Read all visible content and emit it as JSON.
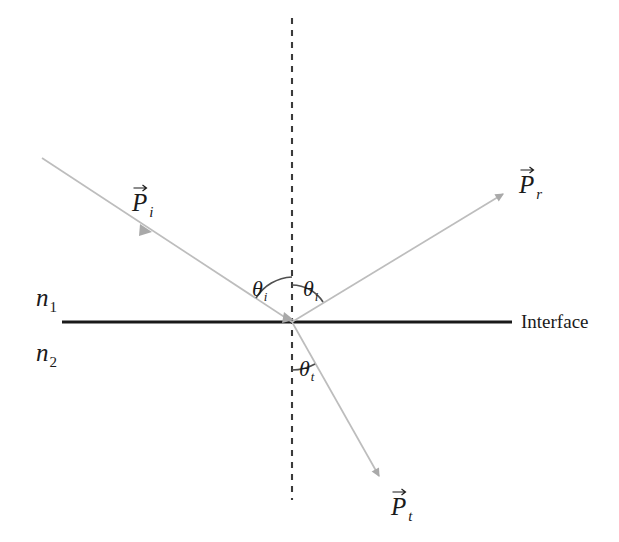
{
  "figure": {
    "type": "optics-ray-diagram",
    "background_color": "#ffffff",
    "ray_color": "#b9b9b9",
    "line_color": "#1a1a1a",
    "arc_color": "#4f4f4f"
  },
  "labels": {
    "media_upper": "n",
    "media_upper_sub": "1",
    "media_lower": "n",
    "media_lower_sub": "2",
    "interface": "Interface",
    "incident_vector": "P",
    "incident_vector_sub": "i",
    "reflected_vector": "P",
    "reflected_vector_sub": "r",
    "transmitted_vector": "P",
    "transmitted_vector_sub": "t",
    "angle_incidence": "θ",
    "angle_incidence_sub": "i",
    "angle_reflection": "θ",
    "angle_reflection_sub": "i",
    "angle_transmission": "θ",
    "angle_transmission_sub": "t"
  },
  "geometry": {
    "vertex": {
      "x": 292,
      "y": 322
    },
    "normal_line": {
      "x": 292,
      "y_top": 18,
      "y_bottom": 500,
      "style": "dashed"
    },
    "interface_line": {
      "x_left": 62,
      "x_right": 512,
      "y": 322,
      "style": "solid"
    },
    "incident_ray": {
      "x1": 42,
      "y1": 158,
      "x2": 292,
      "y2": 322,
      "arrow_at": {
        "x": 146,
        "y": 230
      }
    },
    "reflected_ray": {
      "x1": 292,
      "y1": 322,
      "x2": 506,
      "y2": 192,
      "arrow_at": {
        "x": 506,
        "y": 192
      }
    },
    "transmitted_ray": {
      "x1": 292,
      "y1": 322,
      "x2": 381,
      "y2": 479,
      "arrow_at": {
        "x": 381,
        "y": 479
      }
    },
    "angle_incidence_deg": 56,
    "angle_reflection_deg": 56,
    "angle_transmission_deg": 29
  },
  "label_positions": {
    "incident_vector": {
      "x": 132,
      "y": 190
    },
    "reflected_vector": {
      "x": 519,
      "y": 172
    },
    "transmitted_vector": {
      "x": 391,
      "y": 494
    },
    "media_upper": {
      "x": 36,
      "y": 285
    },
    "media_lower": {
      "x": 36,
      "y": 340
    },
    "interface": {
      "x": 521,
      "y": 312
    },
    "angle_incidence": {
      "x": 252,
      "y": 278
    },
    "angle_reflection": {
      "x": 303,
      "y": 278
    },
    "angle_transmission": {
      "x": 299,
      "y": 358
    }
  }
}
